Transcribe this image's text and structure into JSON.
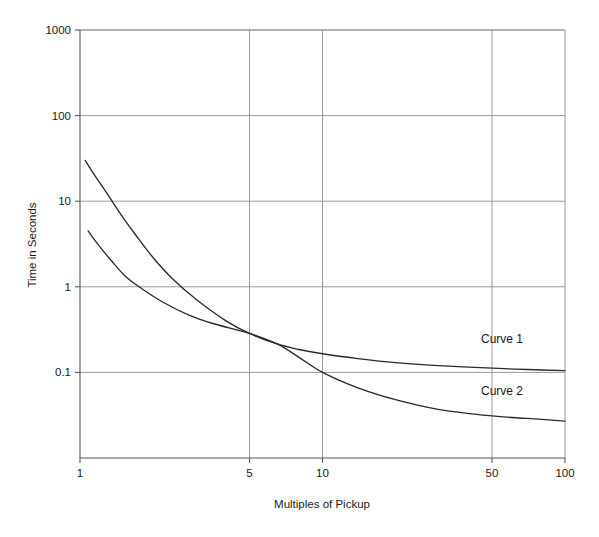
{
  "chart_data": {
    "type": "line",
    "title": "",
    "subtitle": "",
    "xlabel": "Multiples of Pickup",
    "ylabel": "Time in Seconds",
    "xscale": "log",
    "yscale": "log",
    "xlim": [
      1,
      100
    ],
    "ylim": [
      0.01,
      1000
    ],
    "grid": true,
    "legend_position": "inline-right",
    "xticks": [
      1,
      5,
      10,
      50,
      100
    ],
    "xtick_labels": [
      "1",
      "5",
      "10",
      "50",
      "100"
    ],
    "yticks": [
      0.1,
      1,
      10,
      100,
      1000
    ],
    "ytick_labels": [
      "0.1",
      "1",
      "10",
      "100",
      "1000"
    ],
    "annotations": [
      {
        "text": "Curve 1",
        "x": 55,
        "y": 0.22
      },
      {
        "text": "Curve 2",
        "x": 55,
        "y": 0.055
      }
    ],
    "series": [
      {
        "name": "Curve 1",
        "label": "Curve 1",
        "color": "#2b2b2b",
        "points": [
          {
            "x": 1.05,
            "y": 30.0
          },
          {
            "x": 1.15,
            "y": 20.0
          },
          {
            "x": 1.3,
            "y": 12.0
          },
          {
            "x": 1.5,
            "y": 6.5
          },
          {
            "x": 1.7,
            "y": 4.0
          },
          {
            "x": 2.0,
            "y": 2.2
          },
          {
            "x": 2.4,
            "y": 1.25
          },
          {
            "x": 3.0,
            "y": 0.72
          },
          {
            "x": 4.0,
            "y": 0.4
          },
          {
            "x": 5.0,
            "y": 0.285
          },
          {
            "x": 6.5,
            "y": 0.215
          },
          {
            "x": 8.0,
            "y": 0.185
          },
          {
            "x": 10.0,
            "y": 0.165
          },
          {
            "x": 14.0,
            "y": 0.145
          },
          {
            "x": 20.0,
            "y": 0.13
          },
          {
            "x": 30.0,
            "y": 0.12
          },
          {
            "x": 50.0,
            "y": 0.112
          },
          {
            "x": 70.0,
            "y": 0.108
          },
          {
            "x": 100.0,
            "y": 0.105
          }
        ]
      },
      {
        "name": "Curve 2",
        "label": "Curve 2",
        "color": "#2b2b2b",
        "points": [
          {
            "x": 1.08,
            "y": 4.5
          },
          {
            "x": 1.2,
            "y": 3.0
          },
          {
            "x": 1.35,
            "y": 2.0
          },
          {
            "x": 1.55,
            "y": 1.3
          },
          {
            "x": 1.8,
            "y": 0.95
          },
          {
            "x": 2.2,
            "y": 0.66
          },
          {
            "x": 2.8,
            "y": 0.47
          },
          {
            "x": 3.5,
            "y": 0.375
          },
          {
            "x": 5.0,
            "y": 0.285
          },
          {
            "x": 6.5,
            "y": 0.215
          },
          {
            "x": 8.0,
            "y": 0.15
          },
          {
            "x": 10.0,
            "y": 0.1
          },
          {
            "x": 14.0,
            "y": 0.066
          },
          {
            "x": 20.0,
            "y": 0.048
          },
          {
            "x": 30.0,
            "y": 0.037
          },
          {
            "x": 50.0,
            "y": 0.031
          },
          {
            "x": 70.0,
            "y": 0.029
          },
          {
            "x": 100.0,
            "y": 0.027
          }
        ]
      }
    ]
  },
  "colors": {
    "background": "#ffffff",
    "axis": "#555555",
    "grid": "#9a9a9a",
    "curve": "#2b2b2b",
    "text": "#1a1a1a"
  }
}
